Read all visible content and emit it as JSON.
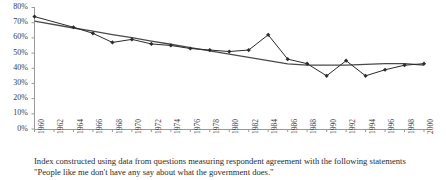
{
  "chart_data": {
    "type": "line",
    "title": "",
    "subtitle": "",
    "xlabel": "",
    "ylabel": "",
    "grid": false,
    "legend_position": "none",
    "xlim": [
      1960,
      2000
    ],
    "ylim": [
      0,
      80
    ],
    "y_tick_labels": [
      "0%",
      "10%",
      "20%",
      "30%",
      "40%",
      "50%",
      "60%",
      "70%",
      "80%"
    ],
    "y_tick_values": [
      0,
      10,
      20,
      30,
      40,
      50,
      60,
      70,
      80
    ],
    "x_tick_labels": [
      "1960",
      "1962",
      "1964",
      "1966",
      "1968",
      "1970",
      "1972",
      "1974",
      "1976",
      "1978",
      "1980",
      "1982",
      "1984",
      "1986",
      "1988",
      "1990",
      "1992",
      "1994",
      "1996",
      "1998",
      "2000"
    ],
    "x_tick_values": [
      1960,
      1962,
      1964,
      1966,
      1968,
      1970,
      1972,
      1974,
      1976,
      1978,
      1980,
      1982,
      1984,
      1986,
      1988,
      1990,
      1992,
      1994,
      1996,
      1998,
      2000
    ],
    "x": [
      1960,
      1964,
      1966,
      1968,
      1970,
      1972,
      1974,
      1976,
      1978,
      1980,
      1982,
      1984,
      1986,
      1988,
      1990,
      1992,
      1994,
      1996,
      1998,
      2000
    ],
    "series": [
      {
        "name": "Index",
        "type": "line-with-markers",
        "marker": "diamond",
        "color": "#2b2b2b",
        "values": [
          74,
          67,
          63,
          57,
          59,
          56,
          55,
          53,
          52,
          51,
          52,
          62,
          46,
          43,
          35,
          45,
          35,
          39,
          42,
          43
        ]
      },
      {
        "name": "Linear trendline",
        "type": "trendline",
        "marker": "none",
        "color": "#4a4a4a",
        "values": [
          71,
          66.5,
          64.4,
          62.2,
          60.1,
          57.9,
          55.8,
          53.6,
          51.5,
          49.3,
          47.2,
          45.0,
          42.9,
          42.0,
          42.0,
          42.0,
          42.5,
          43.0,
          43.0,
          42.0
        ]
      }
    ]
  },
  "caption": {
    "line1": "Index constructed using data from questions measuring respondent agreement with the following statements",
    "line2": "\"People like me don't have any say about what the government does.\""
  },
  "colors": {
    "axis": "#9a9a9a",
    "series": "#2b2b2b",
    "trendline": "#4a4a4a",
    "text": "#2b2b2b",
    "background": "#ffffff"
  }
}
